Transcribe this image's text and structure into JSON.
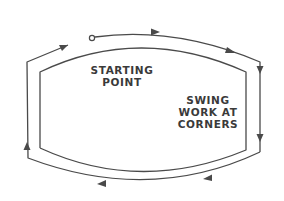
{
  "diagram": {
    "type": "path-direction-diagram",
    "stroke_color": "#4a4a4a",
    "labels": {
      "starting_point": [
        "STARTING",
        "POINT"
      ],
      "swing": [
        "SWING",
        "WORK AT",
        "CORNERS"
      ]
    },
    "markers": {
      "start": "open-circle",
      "direction": "clockwise",
      "arrow_count": 7
    }
  }
}
